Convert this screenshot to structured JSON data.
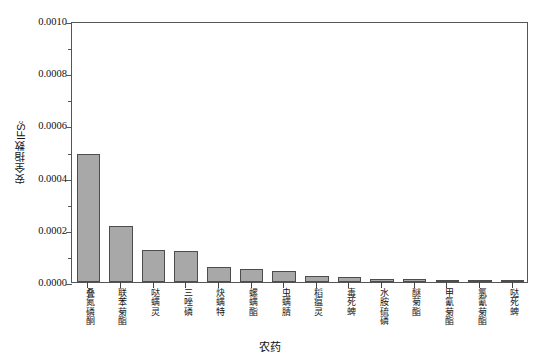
{
  "chart_data": {
    "type": "bar",
    "title": "",
    "xlabel": "农药",
    "ylabel": "安全指数IFS",
    "ylabel_subscript": "c",
    "ylim": [
      0.0,
      0.001
    ],
    "ytick_labels": [
      "0.0010",
      "0.0008",
      "0.0006",
      "0.0004",
      "0.0002",
      "0.0000"
    ],
    "ytick_values": [
      0.001,
      0.0008,
      0.0006,
      0.0004,
      0.0002,
      0.0
    ],
    "yminor_values": [
      0.0009,
      0.0007,
      0.0005,
      0.0003,
      0.0001
    ],
    "grid": false,
    "legend": "none",
    "bar_color": "#a8a8a8",
    "bar_edge_color": "#4d4d4d",
    "categories": [
      "叠氮磷酮",
      "联苯菊酯",
      "哒螨灵",
      "三唑磷",
      "炔螨特",
      "螺螨酯",
      "虫螨腈",
      "稻瘟灵",
      "毒死蜱",
      "水胺硫磷",
      "醚菊酯",
      "甲氰菊酯",
      "氯氰菊酯",
      "哒死蜱"
    ],
    "values": [
      0.00049,
      0.000215,
      0.000122,
      0.000118,
      5.7e-05,
      5e-05,
      4.4e-05,
      2.4e-05,
      2e-05,
      1.2e-05,
      1.1e-05,
      9e-06,
      6e-06,
      4e-06
    ]
  }
}
